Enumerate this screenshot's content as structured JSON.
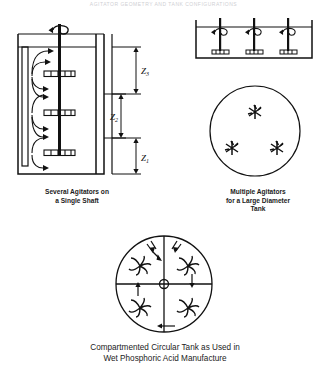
{
  "header": {
    "text": "AGITATOR GEOMETRY AND TANK CONFIGURATIONS"
  },
  "figures": [
    {
      "id": "several-agitators-single-shaft",
      "caption": "Several Agitators on\na Single Shaft",
      "view": "elevation",
      "tank": {
        "shape": "cylindrical-vertical",
        "baffles": 1
      },
      "shaft": {
        "count": 1,
        "rotation_indicator": "curved-arrow-loop"
      },
      "impellers": {
        "count": 3,
        "type": "flat-blade-turbine"
      },
      "flow_pattern": "radial-discharge-with-circulation-loops",
      "dimensions": [
        {
          "label": "Z3",
          "sub": "3",
          "meaning": "liquid-surface-to-top-impeller"
        },
        {
          "label": "Z2",
          "sub": "2",
          "meaning": "impeller-spacing"
        },
        {
          "label": "Z1",
          "sub": "1",
          "meaning": "bottom-impeller-to-tank-floor"
        }
      ]
    },
    {
      "id": "multiple-agitators-large-diameter-tank",
      "caption": "Multiple Agitators\nfor a Large Diameter\nTank",
      "views": [
        {
          "view": "elevation",
          "tank": "rectangular-wide",
          "shafts": 3,
          "impellers_per_shaft": 1
        },
        {
          "view": "plan",
          "tank": "circular",
          "agitators": 3,
          "symbol": "star-impeller"
        }
      ]
    },
    {
      "id": "compartmented-circular-tank",
      "caption": "Compartmented Circular Tank as Used in\nWet Phosphoric Acid Manufacture",
      "view": "plan",
      "tank": {
        "shape": "circular",
        "compartments": 4,
        "dividers": "cross-partition",
        "center_hub": true
      },
      "impellers": {
        "count": 4,
        "type": "curved-blade",
        "one_per_compartment": true
      },
      "nozzles": [
        {
          "name": "inlet",
          "position": "top-left"
        },
        {
          "name": "outlet",
          "position": "top-right"
        }
      ],
      "flow_arrows": {
        "count": 4,
        "direction": "counter-clockwise-circulation"
      }
    }
  ],
  "colors": {
    "ink": "#111111",
    "paper": "#ffffff",
    "header_text": "#cfcfd4"
  }
}
